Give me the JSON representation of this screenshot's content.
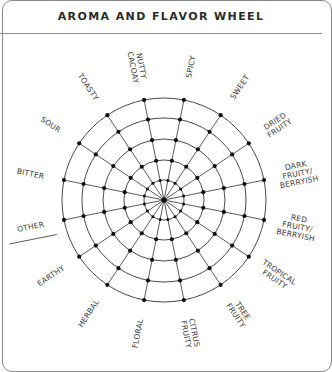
{
  "header": {
    "title": "AROMA AND FLAVOR WHEEL"
  },
  "wheel": {
    "center": [
      164,
      200
    ],
    "ring_radii": [
      102,
      82,
      61,
      40,
      20
    ],
    "spoke_count": 16,
    "spoke_offset_deg": 11.25,
    "line_color": "#4a4a4a",
    "node_color": "#111111"
  },
  "categories": [
    {
      "lines": [
        "NUTTY",
        "CACOAY"
      ]
    },
    {
      "lines": [
        "SPICY"
      ]
    },
    {
      "lines": [
        "SWEET"
      ]
    },
    {
      "lines": [
        "DRIED",
        "FRUITY"
      ]
    },
    {
      "lines": [
        "DARK",
        "FRUITY/",
        "BERRYISH"
      ]
    },
    {
      "lines": [
        "RED",
        "FRUITY/",
        "BERRYISH"
      ]
    },
    {
      "lines": [
        "TROPICAL",
        "FRUITY"
      ]
    },
    {
      "lines": [
        "TREE",
        "FRUITY"
      ]
    },
    {
      "lines": [
        "CITRUS",
        "FRUITY"
      ]
    },
    {
      "lines": [
        "FLORAL"
      ]
    },
    {
      "lines": [
        "HERBAL"
      ]
    },
    {
      "lines": [
        "EARTHY"
      ]
    },
    {
      "lines": [
        "OTHER"
      ],
      "write_in_line": true
    },
    {
      "lines": [
        "BITTER"
      ]
    },
    {
      "lines": [
        "SOUR"
      ]
    },
    {
      "lines": [
        "TOASTY"
      ]
    }
  ]
}
